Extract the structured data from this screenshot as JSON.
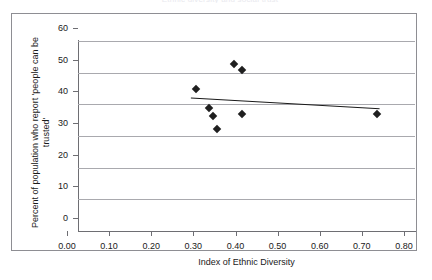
{
  "figure": {
    "title_remnant": "Ethnic diversity and social trust",
    "background_color": "#ffffff",
    "frame_color": "#8e8e93",
    "marker_color": "#1f1f1f",
    "gridline_color": "#a9a9ae",
    "trendline_color": "#1a1a1a"
  },
  "chart_data": {
    "type": "scatter",
    "title": "",
    "xlabel": "Index of Ethnic Diversity",
    "ylabel": "Percent of population who report 'people can be trusted'",
    "xlim": [
      0.0,
      0.8
    ],
    "ylim": [
      0,
      60
    ],
    "xticks": [
      "0.00",
      "0.10",
      "0.20",
      "0.30",
      "0.40",
      "0.50",
      "0.60",
      "0.70",
      "0.80"
    ],
    "xtick_values": [
      0.0,
      0.1,
      0.2,
      0.3,
      0.4,
      0.5,
      0.6,
      0.7,
      0.8
    ],
    "yticks": [
      "0",
      "10",
      "20",
      "30",
      "40",
      "50",
      "60"
    ],
    "ytick_values": [
      0,
      10,
      20,
      30,
      40,
      50,
      60
    ],
    "grid": "horizontal",
    "legend": "none",
    "marker": "filled-diamond",
    "points": [
      {
        "x": 0.28,
        "y": 45.0
      },
      {
        "x": 0.31,
        "y": 39.0
      },
      {
        "x": 0.32,
        "y": 36.2
      },
      {
        "x": 0.33,
        "y": 32.3
      },
      {
        "x": 0.37,
        "y": 52.8
      },
      {
        "x": 0.39,
        "y": 51.0
      },
      {
        "x": 0.39,
        "y": 37.0
      },
      {
        "x": 0.71,
        "y": 36.8
      }
    ],
    "trendline": {
      "type": "linear",
      "x_start": 0.268,
      "y_start": 42.0,
      "x_end": 0.716,
      "y_end": 38.6
    }
  }
}
